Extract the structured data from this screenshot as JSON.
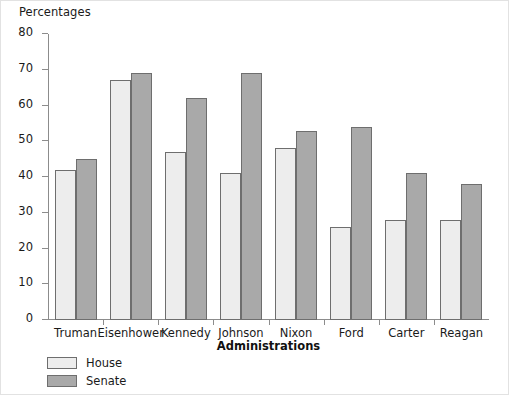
{
  "chart_data": {
    "type": "bar",
    "title": "",
    "xlabel": "Administrations",
    "ylabel": "Percentages",
    "categories": [
      "Truman",
      "Eisenhower",
      "Kennedy",
      "Johnson",
      "Nixon",
      "Ford",
      "Carter",
      "Reagan"
    ],
    "series": [
      {
        "name": "House",
        "color": "#ededed",
        "values": [
          42,
          67,
          47,
          41,
          48,
          26,
          28,
          28
        ]
      },
      {
        "name": "Senate",
        "color": "#a9a9a9",
        "values": [
          45,
          69,
          62,
          69,
          53,
          54,
          41,
          38
        ]
      }
    ],
    "ylim": [
      0,
      80
    ],
    "yticks": [
      0,
      10,
      20,
      30,
      40,
      50,
      60,
      70,
      80
    ],
    "ytick_labels": [
      "0",
      "10",
      "20",
      "30",
      "40",
      "50",
      "60",
      "70",
      "80"
    ],
    "grid": false,
    "legend_position": "below-left"
  },
  "legend": {
    "items": [
      {
        "label": "House",
        "swatch": "house"
      },
      {
        "label": "Senate",
        "swatch": "senate"
      }
    ]
  }
}
